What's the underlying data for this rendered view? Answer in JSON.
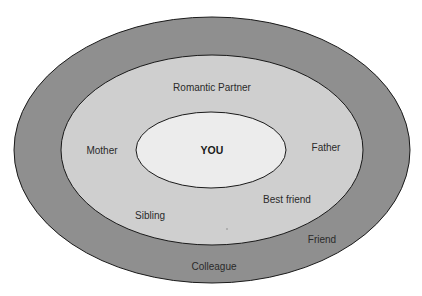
{
  "diagram": {
    "type": "concentric-ellipses",
    "colors": {
      "background": "#ffffff",
      "outer_ring": "#8f8f8f",
      "middle_ring": "#cfcfcf",
      "inner": "#ececec",
      "stroke": "#1a1a1a"
    },
    "center": {
      "label": "YOU"
    },
    "middle_ring": {
      "labels": {
        "romantic_partner": "Romantic Partner",
        "mother": "Mother",
        "father": "Father",
        "best_friend": "Best friend",
        "sibling": "Sibling"
      }
    },
    "outer_ring": {
      "labels": {
        "friend": "Friend",
        "colleague": "Colleague"
      }
    }
  }
}
